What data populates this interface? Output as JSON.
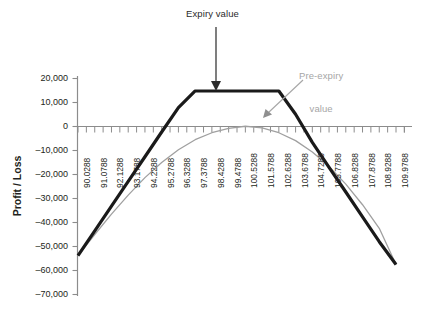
{
  "chart_data": {
    "type": "line",
    "title": "",
    "xlabel": "",
    "ylabel": "Profit / Loss",
    "grid": false,
    "legend_position": "annotations",
    "xlim": [
      90.0288,
      109.9788
    ],
    "ylim": [
      -70000,
      20000
    ],
    "ytick_values": [
      20000,
      10000,
      0,
      -10000,
      -20000,
      -30000,
      -40000,
      -50000,
      -60000,
      -70000
    ],
    "ytick_labels": [
      "20,000",
      "10,000",
      "0",
      "–10,000",
      "–20,000",
      "–30,000",
      "–40,000",
      "–50,000",
      "–60,000",
      "–70,000"
    ],
    "categories": [
      "90.0288",
      "91.0788",
      "92.1288",
      "93.1788",
      "94.2288",
      "95.2788",
      "96.3288",
      "97.3788",
      "98.4288",
      "99.4788",
      "100.5288",
      "101.5788",
      "102.6288",
      "103.6788",
      "104.7288",
      "105.7788",
      "106.8288",
      "107.8788",
      "108.9288",
      "109.9788"
    ],
    "x": [
      90.0288,
      91.0788,
      92.1288,
      93.1788,
      94.2288,
      95.2788,
      96.3288,
      97.3788,
      98.4288,
      99.4788,
      100.5288,
      101.5788,
      102.6288,
      103.6788,
      104.7288,
      105.7788,
      106.8288,
      107.8788,
      108.9288,
      109.9788
    ],
    "series": [
      {
        "name": "Expiry value",
        "color": "#1a1a1a",
        "width": 3.2,
        "values": [
          -53800,
          -43500,
          -33200,
          -22900,
          -12600,
          -2300,
          7900,
          14800,
          14800,
          14800,
          14800,
          14800,
          14800,
          5100,
          -6600,
          -17000,
          -27300,
          -37700,
          -48000,
          -57500
        ]
      },
      {
        "name": "Pre-expiry value",
        "color": "#a0a0a0",
        "width": 1.3,
        "values": [
          -53800,
          -45000,
          -36500,
          -28600,
          -21300,
          -15000,
          -9700,
          -5500,
          -2600,
          -800,
          100,
          -600,
          -2600,
          -5900,
          -10600,
          -16600,
          -24000,
          -32600,
          -42400,
          -57500
        ]
      }
    ],
    "annotations": [
      {
        "id": "expiry-callout",
        "text": "Expiry value",
        "color": "#2b2b2b",
        "arrow": "down",
        "points_to": "plateau of black expiry line"
      },
      {
        "id": "preexpiry-callout",
        "text": "Pre-expiry\nvalue",
        "line1": "Pre-expiry",
        "line2": "value",
        "color": "#a6a6a6",
        "arrow": "down-left",
        "points_to": "gray pre-expiry curve"
      }
    ],
    "colors": {
      "expiry_line": "#1a1a1a",
      "preexpiry_line": "#a0a0a0",
      "axis": "#808080",
      "text": "#231f20",
      "background": "#ffffff"
    }
  }
}
